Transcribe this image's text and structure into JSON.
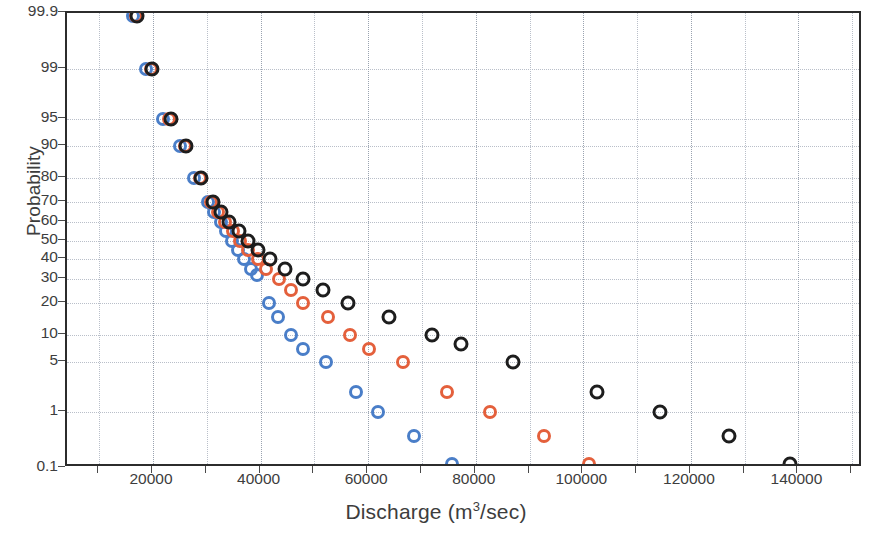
{
  "chart_data": {
    "type": "scatter",
    "title": "",
    "xlabel": "Discharge (m3/sec)",
    "xlabel_html": "Discharge (m<sup>3</sup>/sec)",
    "ylabel": "Probability",
    "xlim": [
      4000,
      152000
    ],
    "xticks": [
      20000,
      40000,
      60000,
      80000,
      100000,
      120000,
      140000
    ],
    "xtick_labels": [
      "20000",
      "40000",
      "60000",
      "80000",
      "100000",
      "120000",
      "140000"
    ],
    "x_minor_ticks": [
      10000,
      30000,
      50000,
      70000,
      90000,
      110000,
      130000,
      150000
    ],
    "yscale": "normal-probability",
    "ylim": [
      0.1,
      99.9
    ],
    "yticks": [
      99.9,
      99,
      95,
      90,
      80,
      70,
      60,
      50,
      40,
      30,
      20,
      10,
      5,
      1,
      0.1
    ],
    "ytick_labels": [
      "99.9",
      "99",
      "95",
      "90",
      "80",
      "70",
      "60",
      "50",
      "40",
      "30",
      "20",
      "10",
      "5",
      "1",
      "0.1"
    ],
    "grid": true,
    "grid_style": "dotted",
    "legend": "none",
    "marker": "open-circle",
    "colors": {
      "series_blue": "#4a7ec8",
      "series_orange": "#e4603c",
      "series_black": "#1d1d1d",
      "axis": "#2c2c2c",
      "grid": "#b9bfc9",
      "text": "#3d3d3d"
    },
    "series": [
      {
        "name": "Series blue",
        "color": "#4a7ec8",
        "points": [
          [
            16200,
            99.9
          ],
          [
            18600,
            99.0
          ],
          [
            21800,
            95.0
          ],
          [
            25000,
            90.0
          ],
          [
            27600,
            80.0
          ],
          [
            30200,
            70.0
          ],
          [
            31400,
            65.0
          ],
          [
            32600,
            60.0
          ],
          [
            33600,
            55.0
          ],
          [
            34600,
            50.0
          ],
          [
            35800,
            45.0
          ],
          [
            36900,
            40.0
          ],
          [
            38200,
            35.0
          ],
          [
            39400,
            32.0
          ],
          [
            41500,
            20.0
          ],
          [
            43200,
            15.0
          ],
          [
            45600,
            10.0
          ],
          [
            47800,
            7.0
          ],
          [
            52200,
            5.0
          ],
          [
            57800,
            2.0
          ],
          [
            61800,
            1.0
          ],
          [
            68600,
            0.4
          ],
          [
            75600,
            0.12
          ]
        ]
      },
      {
        "name": "Series orange",
        "color": "#e4603c",
        "points": [
          [
            16800,
            99.9
          ],
          [
            19600,
            99.0
          ],
          [
            23000,
            95.0
          ],
          [
            26000,
            90.0
          ],
          [
            28800,
            80.0
          ],
          [
            30800,
            70.0
          ],
          [
            32000,
            65.0
          ],
          [
            33400,
            60.0
          ],
          [
            34800,
            55.0
          ],
          [
            36200,
            50.0
          ],
          [
            37600,
            45.0
          ],
          [
            39600,
            40.0
          ],
          [
            41000,
            35.0
          ],
          [
            43400,
            30.0
          ],
          [
            45600,
            25.0
          ],
          [
            47800,
            20.0
          ],
          [
            52600,
            15.0
          ],
          [
            56600,
            10.0
          ],
          [
            60200,
            7.0
          ],
          [
            66400,
            5.0
          ],
          [
            74600,
            2.0
          ],
          [
            82600,
            1.0
          ],
          [
            92600,
            0.4
          ],
          [
            101000,
            0.12
          ]
        ]
      },
      {
        "name": "Series black",
        "color": "#1d1d1d",
        "points": [
          [
            17000,
            99.9
          ],
          [
            19800,
            99.0
          ],
          [
            23400,
            95.0
          ],
          [
            26200,
            90.0
          ],
          [
            29000,
            80.0
          ],
          [
            31200,
            70.0
          ],
          [
            32600,
            65.0
          ],
          [
            34200,
            60.0
          ],
          [
            36000,
            55.0
          ],
          [
            37600,
            50.0
          ],
          [
            39600,
            45.0
          ],
          [
            41800,
            40.0
          ],
          [
            44600,
            35.0
          ],
          [
            47800,
            30.0
          ],
          [
            51600,
            25.0
          ],
          [
            56200,
            20.0
          ],
          [
            63800,
            15.0
          ],
          [
            71800,
            10.0
          ],
          [
            77200,
            8.0
          ],
          [
            87000,
            5.0
          ],
          [
            102600,
            2.0
          ],
          [
            114200,
            1.0
          ],
          [
            127000,
            0.4
          ],
          [
            138400,
            0.12
          ]
        ]
      }
    ]
  }
}
